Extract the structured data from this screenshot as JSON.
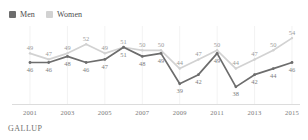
{
  "title_sliver": "",
  "legend": {
    "items": [
      {
        "label": "Men",
        "color": "#6d6d6d",
        "key": "men"
      },
      {
        "label": "Women",
        "color": "#d2d2d2",
        "key": "women"
      }
    ]
  },
  "source": "GALLUP",
  "axis": {
    "tick_labels": [
      "2001",
      "2003",
      "2005",
      "2007",
      "2009",
      "2011",
      "2013",
      "2015"
    ]
  },
  "chart_data": {
    "type": "line",
    "title": "",
    "subtitle": "",
    "xlabel": "",
    "ylabel": "",
    "ylim": [
      35,
      56
    ],
    "xlim": [
      2001,
      2015
    ],
    "grid": true,
    "grid_axis": "x",
    "legend_position": "top-left",
    "x": [
      2001,
      2002,
      2003,
      2004,
      2005,
      2006,
      2007,
      2008,
      2009,
      2010,
      2011,
      2012,
      2013,
      2014,
      2015
    ],
    "tick_values": [
      2001,
      2003,
      2005,
      2007,
      2009,
      2011,
      2013,
      2015
    ],
    "series": [
      {
        "name": "Men",
        "color": "#6d6d6d",
        "label_position": "below",
        "values": [
          46,
          46,
          48,
          46,
          47,
          51,
          48,
          49,
          39,
          42,
          49,
          38,
          42,
          44,
          46
        ],
        "point_labels": [
          "46",
          "46",
          "48",
          "46",
          "47",
          "51",
          "48",
          "49",
          "39",
          "42",
          "49",
          "38",
          "42",
          "44",
          "46"
        ]
      },
      {
        "name": "Women",
        "color": "#d2d2d2",
        "label_position": "above",
        "values": [
          49,
          47,
          49,
          52,
          49,
          51,
          50,
          50,
          44,
          47,
          50,
          44,
          47,
          50,
          54
        ],
        "point_labels": [
          "49",
          "47",
          "49",
          "52",
          "49",
          "51",
          "50",
          "50",
          "44",
          "47",
          "50",
          "44",
          "47",
          "50",
          "54"
        ]
      }
    ]
  }
}
